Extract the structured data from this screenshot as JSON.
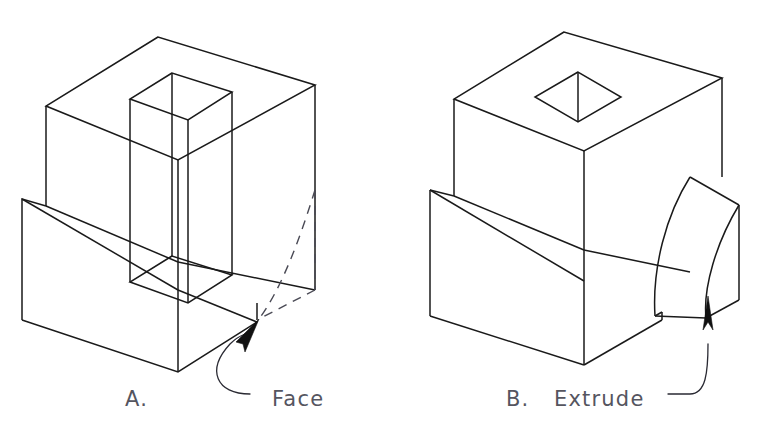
{
  "figure": {
    "title": "",
    "background_color": "#ffffff",
    "line_color": "#1a1a1a",
    "hidden_line_color": "#4a4a55",
    "text_color": "#55555f",
    "width": 763,
    "height": 442
  },
  "panels": [
    {
      "id": "panel-a",
      "caption": "A.",
      "annotation": "Face",
      "description": "Isometric wireframe block with a vertical rectangular through-prism and a hidden dashed rounded face on the lower right corner",
      "geometry": {
        "outer_block": {
          "top_apex": [
            158,
            37
          ],
          "top_left": [
            46,
            106
          ],
          "top_right": [
            315,
            85
          ],
          "top_front": [
            178,
            160
          ],
          "left_bottom": [
            46,
            206
          ],
          "front_bottom": [
            178,
            262
          ],
          "right_bottom": [
            315,
            290
          ]
        },
        "step_ledge": {
          "ledge_left": [
            22,
            199
          ],
          "ledge_front": [
            178,
            290
          ],
          "base_left_bottom": [
            22,
            320
          ],
          "base_front_bottom": [
            178,
            372
          ],
          "base_right": [
            257,
            322
          ]
        },
        "inner_prism": {
          "top_apex": [
            172,
            73
          ],
          "top_left": [
            130,
            99
          ],
          "top_right": [
            232,
            92
          ],
          "top_front": [
            188,
            120
          ],
          "bottom_front": [
            188,
            303
          ],
          "bottom_left": [
            130,
            282
          ],
          "bottom_right": [
            232,
            275
          ]
        },
        "hidden_face": {
          "arc_start": [
            315,
            190
          ],
          "arc_end": [
            257,
            322
          ],
          "corner": [
            315,
            290
          ]
        }
      }
    },
    {
      "id": "panel-b",
      "caption": "B.",
      "annotation": "Extrude",
      "description": "Isometric solid block with a square through-hole in the top face and a curved fillet extrusion on the right side",
      "geometry": {
        "main_block": {
          "top_apex": [
            564,
            32
          ],
          "top_left": [
            454,
            99
          ],
          "top_right": [
            722,
            78
          ],
          "top_front": [
            584,
            151
          ],
          "left_bottom": [
            454,
            196
          ],
          "front_bottom": [
            584,
            250
          ],
          "right_bottom": [
            722,
            280
          ]
        },
        "square_hole": {
          "back": [
            578,
            72
          ],
          "left": [
            535,
            97
          ],
          "front": [
            578,
            122
          ],
          "right": [
            621,
            97
          ],
          "depth_bottom": [
            578,
            102
          ]
        },
        "step_ledge": {
          "ledge_left": [
            430,
            190
          ],
          "ledge_front": [
            584,
            281
          ],
          "base_left_bottom": [
            430,
            316
          ],
          "base_front_bottom": [
            584,
            365
          ],
          "base_right": [
            662,
            320
          ]
        },
        "curved_extrusion": {
          "top_back": [
            690,
            177
          ],
          "top_front": [
            739,
            205
          ],
          "arc_base_front": [
            739,
            300
          ],
          "arc_base_back": [
            662,
            320
          ],
          "notch": [
            662,
            312
          ]
        }
      }
    }
  ],
  "annotations": [
    {
      "id": "face-callout",
      "label": "Face",
      "label_position": [
        272,
        399
      ],
      "arrow_tip": [
        259,
        320
      ],
      "arrow_tail": [
        244,
        340
      ],
      "leader_path": "from label left edge curving up and left to the arrow tail"
    },
    {
      "id": "extrude-callout",
      "label": "Extrude",
      "label_position": [
        548,
        399
      ],
      "arrow_tip": [
        708,
        296
      ],
      "arrow_tail": [
        708,
        324
      ],
      "leader_path": "from label right edge curving right and up to the arrow tail"
    }
  ],
  "captions": {
    "a_label": "A.",
    "b_label": "B.",
    "face_label": "Face",
    "extrude_label": "Extrude"
  }
}
